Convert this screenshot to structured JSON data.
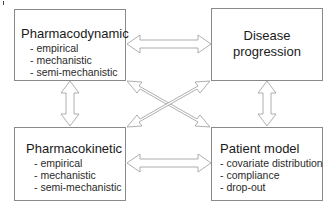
{
  "diagram": {
    "boxes": {
      "pharmacodynamic": {
        "title": "Pharmacodynamic",
        "items": [
          "- empirical",
          "- mechanistic",
          "- semi-mechanistic"
        ]
      },
      "disease_progression": {
        "title": "Disease progression"
      },
      "pharmacokinetic": {
        "title": "Pharmacokinetic",
        "items": [
          "- empirical",
          "- mechanistic",
          "- semi-mechanistic"
        ]
      },
      "patient_model": {
        "title": "Patient model",
        "items": [
          "- covariate distribution",
          "- compliance",
          "- drop-out"
        ]
      }
    },
    "connections": [
      {
        "from": "Pharmacodynamic",
        "to": "Disease progression",
        "type": "bidirectional"
      },
      {
        "from": "Pharmacodynamic",
        "to": "Pharmacokinetic",
        "type": "bidirectional"
      },
      {
        "from": "Disease progression",
        "to": "Patient model",
        "type": "bidirectional"
      },
      {
        "from": "Pharmacokinetic",
        "to": "Patient model",
        "type": "bidirectional"
      },
      {
        "from": "Pharmacodynamic",
        "to": "Patient model",
        "type": "bidirectional"
      },
      {
        "from": "Pharmacokinetic",
        "to": "Disease progression",
        "type": "bidirectional"
      }
    ],
    "colors": {
      "stroke": "#8a8a8a",
      "fill": "#ffffff",
      "text": "#1a1a1a"
    }
  }
}
